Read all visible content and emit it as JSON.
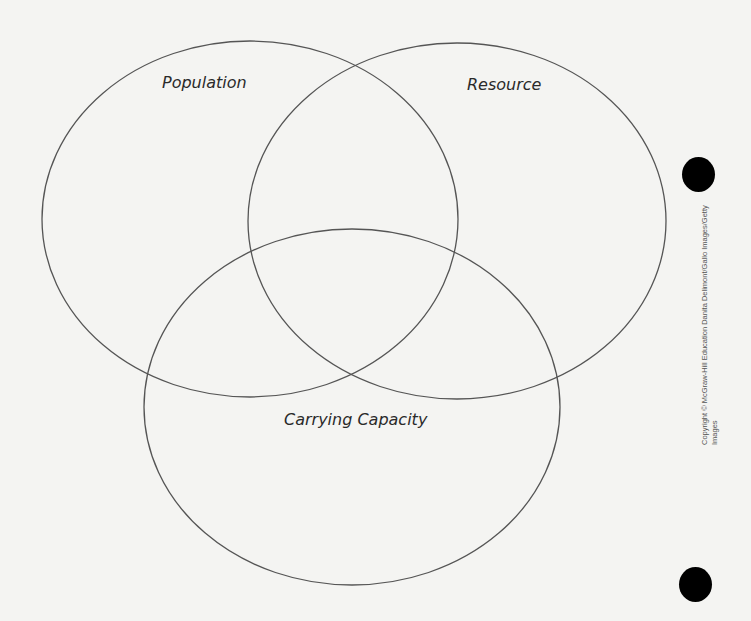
{
  "diagram": {
    "type": "venn",
    "circles": [
      {
        "label": "Population",
        "cx": 250,
        "cy": 219,
        "rx": 208,
        "ry": 178
      },
      {
        "label": "Resource",
        "cx": 457,
        "cy": 221,
        "rx": 209,
        "ry": 178
      },
      {
        "label": "Carrying Capacity",
        "cx": 352,
        "cy": 407,
        "rx": 208,
        "ry": 178
      }
    ],
    "stroke_color": "#555555"
  },
  "credit": {
    "line1": "Copyright © McGraw-Hill Education   Danita Delimont/Gallo Images/Getty",
    "line2": "Images"
  }
}
